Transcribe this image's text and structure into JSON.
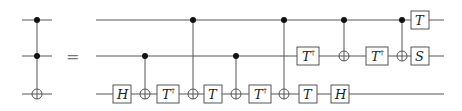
{
  "diagram": {
    "equals_sign": "=",
    "wires_y": [
      20,
      56,
      94
    ],
    "left": {
      "name": "toffoli",
      "x": 37,
      "wire_start": 22,
      "wire_end": 52,
      "controls": [
        0,
        1
      ],
      "target": 2
    },
    "right": {
      "wire_start": 96,
      "wire_end": 444,
      "gates": [
        {
          "type": "box",
          "label": "H",
          "dagger": false,
          "wire": 2,
          "x": 122
        },
        {
          "type": "cnot",
          "control": 1,
          "target": 2,
          "x": 145
        },
        {
          "type": "box",
          "label": "T",
          "dagger": true,
          "wire": 2,
          "x": 168
        },
        {
          "type": "cnot",
          "control": 0,
          "target": 2,
          "x": 193
        },
        {
          "type": "box",
          "label": "T",
          "dagger": false,
          "wire": 2,
          "x": 213
        },
        {
          "type": "cnot",
          "control": 1,
          "target": 2,
          "x": 236
        },
        {
          "type": "box",
          "label": "T",
          "dagger": true,
          "wire": 2,
          "x": 260
        },
        {
          "type": "cnot",
          "control": 0,
          "target": 2,
          "x": 284
        },
        {
          "type": "box",
          "label": "T",
          "dagger": true,
          "wire": 1,
          "x": 308
        },
        {
          "type": "box",
          "label": "T",
          "dagger": false,
          "wire": 2,
          "x": 308
        },
        {
          "type": "cnot",
          "control": 0,
          "target": 1,
          "x": 344
        },
        {
          "type": "box",
          "label": "H",
          "dagger": false,
          "wire": 2,
          "x": 340
        },
        {
          "type": "box",
          "label": "T",
          "dagger": true,
          "wire": 1,
          "x": 377
        },
        {
          "type": "cnot",
          "control": 0,
          "target": 1,
          "x": 402
        },
        {
          "type": "box",
          "label": "T",
          "dagger": false,
          "wire": 0,
          "x": 420
        },
        {
          "type": "box",
          "label": "S",
          "dagger": false,
          "wire": 1,
          "x": 420
        }
      ]
    },
    "colors": {
      "wire": "#555555",
      "control": "#111111",
      "text": "#222222"
    }
  }
}
